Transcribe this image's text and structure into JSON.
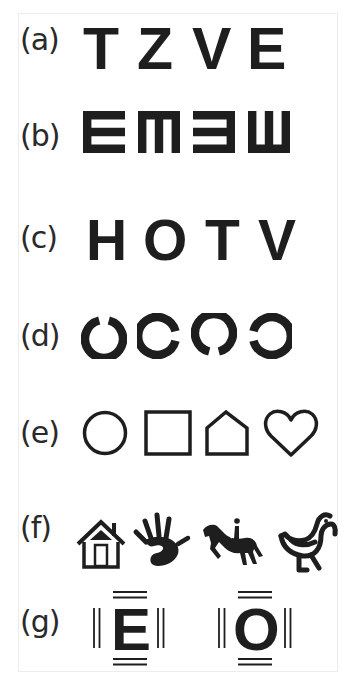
{
  "figure": {
    "rows": [
      {
        "label": "(a)",
        "type": "Sloan letters",
        "items": [
          "T",
          "Z",
          "V",
          "E"
        ]
      },
      {
        "label": "(b)",
        "type": "Tumbling E",
        "items": [
          "E-right",
          "E-down",
          "E-left",
          "E-up"
        ]
      },
      {
        "label": "(c)",
        "type": "HOTV letters",
        "items": [
          "H",
          "O",
          "T",
          "V"
        ]
      },
      {
        "label": "(d)",
        "type": "Landolt C",
        "items": [
          "gap-top",
          "gap-right",
          "gap-bottom",
          "gap-left"
        ]
      },
      {
        "label": "(e)",
        "type": "Lea symbols",
        "items": [
          "circle",
          "square",
          "house",
          "heart"
        ]
      },
      {
        "label": "(f)",
        "type": "Picture optotypes",
        "items": [
          "house",
          "hand",
          "horse-rider",
          "bird"
        ]
      },
      {
        "label": "(g)",
        "type": "Crowded optotypes",
        "items": [
          "E",
          "O"
        ]
      }
    ]
  },
  "colors": {
    "ink": "#1e1e1e",
    "frame": "#ececec",
    "background": "#ffffff"
  }
}
